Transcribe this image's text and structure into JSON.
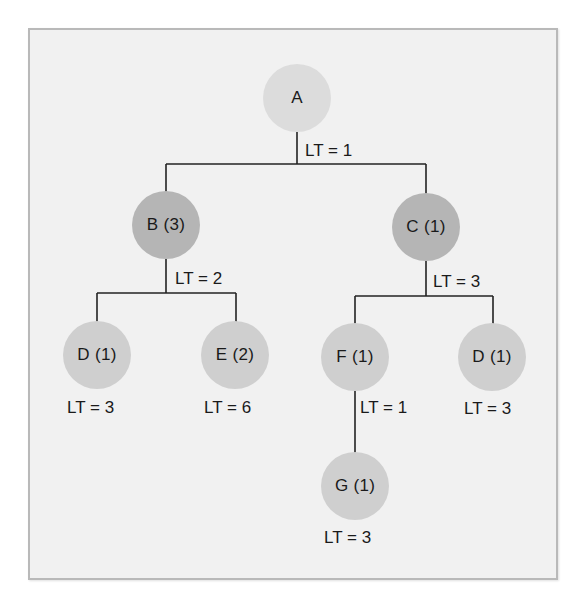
{
  "diagram": {
    "type": "product-structure-tree",
    "colors": {
      "frame_background": "#f1f1f1",
      "frame_border": "#b9b9b9",
      "root_node": "#dcdcdc",
      "level1_node": "#b5b5b5",
      "leaf_node": "#cfcfcf",
      "line": "#222222"
    },
    "nodes": {
      "A": {
        "label": "A",
        "lead_time": "LT = 1"
      },
      "B": {
        "label": "B (3)",
        "lead_time": "LT = 2"
      },
      "C": {
        "label": "C (1)",
        "lead_time": "LT = 3"
      },
      "D_left": {
        "label": "D (1)",
        "lead_time": "LT = 3"
      },
      "E": {
        "label": "E (2)",
        "lead_time": "LT = 6"
      },
      "F": {
        "label": "F (1)",
        "lead_time": "LT = 1"
      },
      "D_right": {
        "label": "D (1)",
        "lead_time": "LT = 3"
      },
      "G": {
        "label": "G (1)",
        "lead_time": "LT = 3"
      }
    },
    "edges": [
      {
        "from": "A",
        "to": "B"
      },
      {
        "from": "A",
        "to": "C"
      },
      {
        "from": "B",
        "to": "D_left"
      },
      {
        "from": "B",
        "to": "E"
      },
      {
        "from": "C",
        "to": "F"
      },
      {
        "from": "C",
        "to": "D_right"
      },
      {
        "from": "F",
        "to": "G"
      }
    ]
  }
}
